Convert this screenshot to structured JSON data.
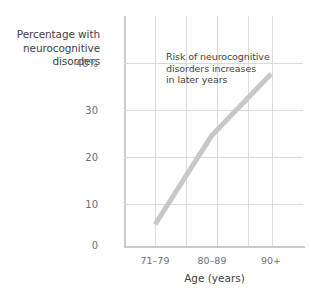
{
  "chart_data": {
    "type": "line",
    "title": "",
    "xlabel": "Age (years)",
    "ylabel": "Percentage with neurocognitive disorders",
    "ylabel_lines": [
      "Percentage with",
      "neurocognitive",
      "disorders"
    ],
    "categories": [
      "71–79",
      "80–89",
      "90+"
    ],
    "values": [
      5,
      24,
      37
    ],
    "ylim": [
      0,
      44
    ],
    "yticks": [
      0,
      10,
      20,
      30,
      40
    ],
    "ytick_labels": [
      "0",
      "10",
      "20",
      "30",
      "40%"
    ],
    "grid": true,
    "legend": "none",
    "series_color": "#c6c7c8",
    "axis_color": "#c9cacb",
    "grid_color": "#d9dadb",
    "text_color": "#3f3f42",
    "tick_text_color": "#6d6e71",
    "annotations": [
      {
        "text": "Risk of neurocognitive disorders increases in later years",
        "lines": [
          "Risk of neurocognitive",
          "disorders increases",
          "in later years"
        ]
      }
    ]
  },
  "axes": {
    "y": {
      "ticks": [
        {
          "label": "40%",
          "value": 40
        },
        {
          "label": "30",
          "value": 30
        },
        {
          "label": "20",
          "value": 20
        },
        {
          "label": "10",
          "value": 10
        },
        {
          "label": "0",
          "value": 0
        }
      ]
    },
    "x": {
      "title": "Age (years)",
      "ticks": [
        {
          "label": "71–79"
        },
        {
          "label": "80–89"
        },
        {
          "label": "90+"
        }
      ]
    }
  }
}
